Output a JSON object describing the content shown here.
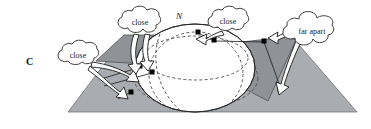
{
  "figure": {
    "background_color": "#ffffff",
    "width": 371,
    "height": 129
  },
  "colors": {
    "plane_fill": "#a9adb1",
    "flap_fill": "#8f9398",
    "sphere_fill": "#ffffff",
    "outline": "#2b2b2b",
    "dashed": "#4a4a4a",
    "arrow_fill": "#ffffff",
    "arrow_stroke": "#1a1a1a",
    "point_marker": "#000000",
    "cloud_fill": "#ffffff",
    "cloud_stroke": "#2b2b2b",
    "text": "#111111"
  },
  "labels": [
    {
      "id": "plane-label",
      "text": "C",
      "style": "bold-serif",
      "x": 26,
      "y": 56
    },
    {
      "id": "pole-label",
      "text": "N",
      "style": "italic-serif",
      "x": 176,
      "y": 11
    }
  ],
  "callouts": [
    {
      "id": "callout-close-left",
      "text": "close",
      "cx": 78,
      "cy": 55,
      "rx": 24,
      "ry": 13,
      "arrows": 2
    },
    {
      "id": "callout-close-upper",
      "text": "close",
      "cx": 140,
      "cy": 22,
      "rx": 25,
      "ry": 13,
      "arrows": 2
    },
    {
      "id": "callout-close-right",
      "text": "close",
      "cx": 228,
      "cy": 21,
      "rx": 24,
      "ry": 13,
      "arrows": 1
    },
    {
      "id": "callout-far-apart",
      "text": "far apart",
      "cx": 312,
      "cy": 31,
      "rx": 31,
      "ry": 13,
      "arrows": 2
    }
  ],
  "point_markers": [
    {
      "id": "marker-upper-left-a",
      "x": 140,
      "y": 66
    },
    {
      "id": "marker-upper-left-b",
      "x": 152,
      "y": 72
    },
    {
      "id": "marker-plane-left",
      "x": 131,
      "y": 92
    },
    {
      "id": "marker-pole-top",
      "x": 198,
      "y": 32
    },
    {
      "id": "marker-right-upper",
      "x": 214,
      "y": 40
    },
    {
      "id": "marker-flap-right",
      "x": 264,
      "y": 41
    },
    {
      "id": "marker-plane-right",
      "x": 280,
      "y": 89
    }
  ],
  "geometry": {
    "plane_shape": "trapezoid",
    "sphere_shape": "ellipse",
    "hidden_contours": "dashed-ellipses",
    "flaps": [
      "upper-left-quad",
      "right-quad"
    ]
  }
}
